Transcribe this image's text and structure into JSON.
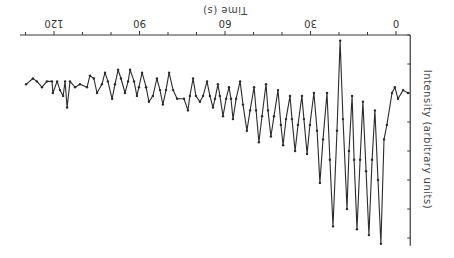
{
  "chart_data": {
    "type": "line",
    "title": "",
    "orientation_note": "figure is displayed rotated 180 degrees",
    "xlabel": "Time (s)",
    "ylabel": "Intensity (arbitrary units)",
    "xlim": [
      -5,
      130
    ],
    "ylim": [
      0,
      7.2
    ],
    "xticks": [
      0,
      30,
      60,
      90,
      120
    ],
    "xtick_labels": [
      "0",
      "30",
      "60",
      "90",
      "120"
    ],
    "x_minor_tick_step": 10,
    "y_tick_step": 1,
    "grid": false,
    "legend": null,
    "series": [
      {
        "name": "intensity",
        "markers": true,
        "points": [
          [
            -4.2,
            2.0
          ],
          [
            -2.5,
            1.9
          ],
          [
            -0.7,
            2.2
          ],
          [
            0.4,
            1.8
          ],
          [
            1.4,
            2.0
          ],
          [
            3.2,
            3.1
          ],
          [
            4.2,
            3.6
          ],
          [
            5.3,
            7.2
          ],
          [
            6.3,
            5.0
          ],
          [
            7.4,
            2.6
          ],
          [
            8.4,
            4.3
          ],
          [
            9.5,
            6.9
          ],
          [
            10.5,
            4.7
          ],
          [
            11.6,
            2.3
          ],
          [
            12.6,
            4.3
          ],
          [
            13.7,
            6.7
          ],
          [
            14.7,
            4.3
          ],
          [
            15.4,
            2.1
          ],
          [
            16.5,
            4.0
          ],
          [
            17.2,
            6.0
          ],
          [
            18.6,
            2.9
          ],
          [
            19.6,
            0.2
          ],
          [
            20.7,
            3.3
          ],
          [
            22.1,
            6.6
          ],
          [
            23.2,
            4.3
          ],
          [
            24.2,
            2.0
          ],
          [
            25.6,
            3.6
          ],
          [
            26.7,
            5.1
          ],
          [
            27.7,
            3.3
          ],
          [
            28.8,
            2.0
          ],
          [
            30.2,
            3.1
          ],
          [
            31.2,
            4.1
          ],
          [
            32.3,
            2.9
          ],
          [
            33.0,
            2.1
          ],
          [
            34.4,
            3.1
          ],
          [
            35.4,
            4.0
          ],
          [
            36.5,
            2.9
          ],
          [
            37.2,
            2.1
          ],
          [
            38.6,
            2.9
          ],
          [
            39.6,
            3.8
          ],
          [
            40.4,
            3.1
          ],
          [
            41.4,
            1.9
          ],
          [
            42.8,
            2.8
          ],
          [
            43.9,
            3.5
          ],
          [
            44.9,
            2.6
          ],
          [
            45.6,
            1.7
          ],
          [
            47.0,
            2.8
          ],
          [
            48.1,
            3.7
          ],
          [
            49.1,
            2.6
          ],
          [
            49.8,
            1.8
          ],
          [
            51.2,
            2.6
          ],
          [
            52.3,
            3.3
          ],
          [
            53.7,
            2.4
          ],
          [
            54.7,
            1.6
          ],
          [
            56.1,
            2.2
          ],
          [
            57.2,
            2.9
          ],
          [
            57.9,
            2.2
          ],
          [
            58.6,
            1.8
          ],
          [
            59.6,
            2.2
          ],
          [
            60.7,
            2.8
          ],
          [
            61.8,
            2.1
          ],
          [
            62.5,
            1.7
          ],
          [
            63.5,
            2.2
          ],
          [
            64.2,
            2.5
          ],
          [
            65.3,
            2.1
          ],
          [
            66.3,
            1.6
          ],
          [
            67.7,
            2.1
          ],
          [
            68.8,
            2.3
          ],
          [
            70.2,
            2.1
          ],
          [
            71.2,
            1.5
          ],
          [
            72.3,
            2.1
          ],
          [
            73.0,
            2.6
          ],
          [
            74.4,
            2.2
          ],
          [
            76.8,
            2.2
          ],
          [
            78.2,
            1.9
          ],
          [
            79.6,
            1.3
          ],
          [
            80.7,
            1.9
          ],
          [
            81.8,
            2.4
          ],
          [
            82.8,
            1.9
          ],
          [
            83.9,
            1.5
          ],
          [
            85.3,
            2.1
          ],
          [
            86.7,
            2.3
          ],
          [
            87.7,
            1.8
          ],
          [
            89.1,
            1.3
          ],
          [
            90.2,
            1.8
          ],
          [
            90.9,
            2.1
          ],
          [
            91.9,
            1.6
          ],
          [
            93.3,
            1.2
          ],
          [
            94.0,
            1.6
          ],
          [
            95.1,
            2.0
          ],
          [
            96.5,
            1.5
          ],
          [
            97.5,
            1.2
          ],
          [
            98.6,
            1.7
          ],
          [
            99.6,
            2.2
          ],
          [
            101.1,
            1.6
          ],
          [
            102.1,
            1.3
          ],
          [
            103.2,
            1.7
          ],
          [
            104.9,
            2.0
          ],
          [
            106.0,
            1.5
          ],
          [
            107.4,
            1.4
          ],
          [
            108.4,
            1.8
          ],
          [
            110.9,
            1.7
          ],
          [
            112.6,
            1.8
          ],
          [
            114.4,
            1.6
          ],
          [
            115.4,
            2.5
          ],
          [
            116.1,
            1.6
          ],
          [
            116.8,
            2.1
          ],
          [
            117.9,
            1.9
          ],
          [
            118.9,
            1.6
          ],
          [
            120.4,
            2.0
          ],
          [
            120.7,
            1.6
          ],
          [
            122.5,
            1.6
          ],
          [
            124.2,
            1.8
          ],
          [
            126.0,
            1.6
          ],
          [
            127.4,
            1.5
          ],
          [
            129.8,
            1.7
          ]
        ]
      }
    ]
  }
}
